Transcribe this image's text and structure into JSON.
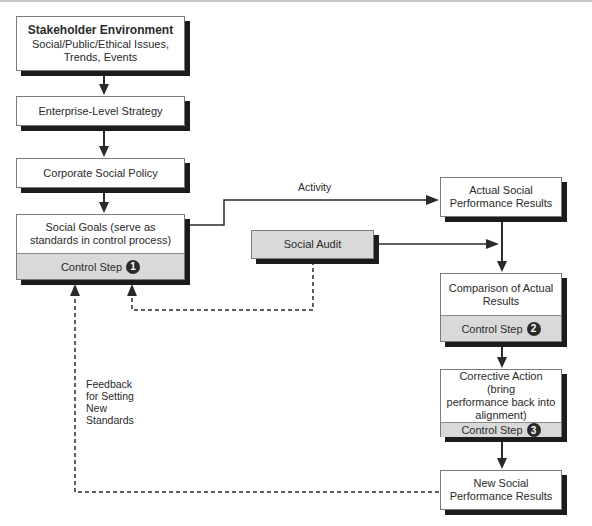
{
  "diagram": {
    "stakeholder": {
      "title": "Stakeholder Environment",
      "line1": "Social/Public/Ethical Issues,",
      "line2": "Trends, Events"
    },
    "enterprise": {
      "label": "Enterprise-Level Strategy"
    },
    "corporate": {
      "label": "Corporate Social Policy"
    },
    "social_goals": {
      "line1": "Social Goals (serve as",
      "line2": "standards in control process)",
      "step_label": "Control Step",
      "step_number": "1"
    },
    "social_audit": {
      "label": "Social Audit"
    },
    "actual_results": {
      "line1": "Actual Social",
      "line2": "Performance Results"
    },
    "comparison": {
      "line1": "Comparison of Actual",
      "line2": "Results",
      "step_label": "Control Step",
      "step_number": "2"
    },
    "corrective": {
      "line1": "Corrective Action (bring",
      "line2": "performance back into",
      "line3": "alignment)",
      "step_label": "Control Step",
      "step_number": "3"
    },
    "new_results": {
      "line1": "New Social",
      "line2": "Performance Results"
    },
    "edge_labels": {
      "activity": "Activity",
      "feedback_line1": "Feedback",
      "feedback_line2": "for Setting",
      "feedback_line3": "New",
      "feedback_line4": "Standards"
    }
  },
  "colors": {
    "line": "#2a2a2a",
    "box_border": "#7a7a7a",
    "shadow": "#1c1c1c",
    "step_fill": "#d9d9d9"
  }
}
